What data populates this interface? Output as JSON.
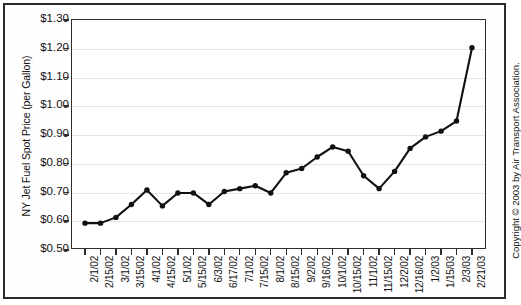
{
  "chart_data": {
    "type": "line",
    "title": "",
    "xlabel": "",
    "ylabel": "NY Jet Fuel Spot Price (per Gallon)",
    "ylim": [
      0.5,
      1.3
    ],
    "ytick_labels": [
      "$1.30",
      "$1.20",
      "$1.10",
      "$1.00",
      "$0.90",
      "$0.80",
      "$0.70",
      "$0.60",
      "$0.50"
    ],
    "ytick_values": [
      1.3,
      1.2,
      1.1,
      1.0,
      0.9,
      0.8,
      0.7,
      0.6,
      0.5
    ],
    "grid": true,
    "legend": "none",
    "marker": "filled-circle",
    "line_color": "#111111",
    "categories": [
      "2/1/02",
      "2/15/02",
      "3/1/02",
      "3/15/02",
      "4/1/02",
      "4/15/02",
      "5/1/02",
      "5/15/02",
      "6/3/02",
      "6/17/02",
      "7/1/02",
      "7/15/02",
      "8/1/02",
      "8/15/02",
      "9/2/02",
      "9/16/02",
      "10/1/02",
      "10/15/02",
      "11/1/02",
      "11/15/02",
      "12/2/02",
      "12/16/02",
      "1/2/03",
      "1/15/03",
      "2/3/03",
      "2/21/03"
    ],
    "values": [
      0.59,
      0.59,
      0.61,
      0.655,
      0.705,
      0.65,
      0.695,
      0.695,
      0.655,
      0.7,
      0.71,
      0.72,
      0.695,
      0.765,
      0.78,
      0.82,
      0.855,
      0.84,
      0.755,
      0.71,
      0.77,
      0.85,
      0.89,
      0.91,
      0.945,
      1.2
    ]
  },
  "footer": {
    "copyright": "Copyright © 2003 by Air Transport Association."
  }
}
